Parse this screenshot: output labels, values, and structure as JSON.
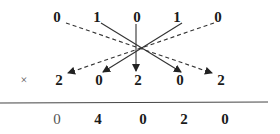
{
  "diagram": {
    "operator": "×",
    "top_row": [
      "0",
      "1",
      "0",
      "1",
      "0"
    ],
    "bottom_row": [
      "2",
      "0",
      "2",
      "0",
      "2"
    ],
    "result_row": [
      "0",
      "4",
      "0",
      "2",
      "0"
    ],
    "arrows": [
      {
        "from": "top_row.0",
        "to": "bottom_row.4",
        "style": "dashed"
      },
      {
        "from": "top_row.1",
        "to": "bottom_row.3",
        "style": "solid"
      },
      {
        "from": "top_row.2",
        "to": "bottom_row.2",
        "style": "solid"
      },
      {
        "from": "top_row.3",
        "to": "bottom_row.1",
        "style": "solid"
      },
      {
        "from": "top_row.4",
        "to": "bottom_row.0",
        "style": "dashed"
      }
    ],
    "colors": {
      "ink": "#1a1a1a",
      "line": "#444444"
    }
  }
}
